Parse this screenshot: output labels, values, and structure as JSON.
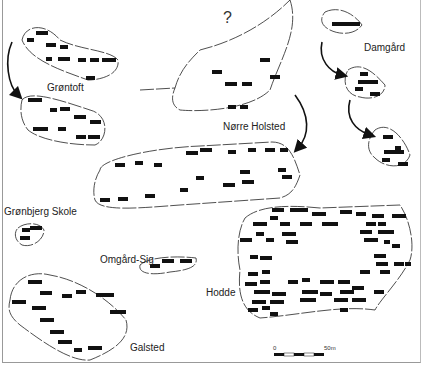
{
  "labels": {
    "question": "?",
    "grontoft": "Grøntoft",
    "damgard": "Damgård",
    "norre_holsted": "Nørre Holsted",
    "gronbjerg_skole": "Grønbjerg Skole",
    "omgard_sig": "Omgård-Sig",
    "hodde": "Hodde",
    "galsted": "Galsted"
  },
  "scale_bar": {
    "start": "0",
    "end": "50m"
  },
  "colors": {
    "line": "#222222",
    "building": "#111111",
    "background": "#ffffff"
  }
}
